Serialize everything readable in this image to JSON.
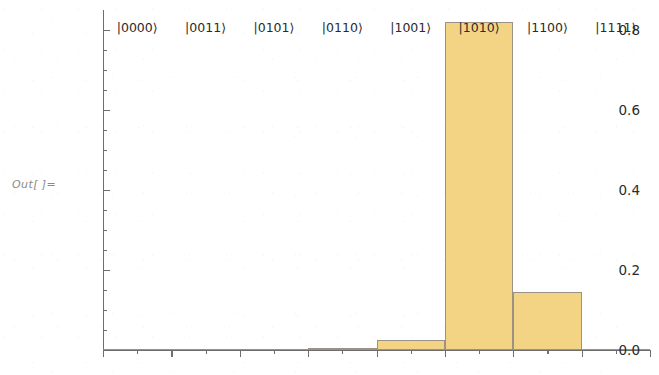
{
  "output_label": "Out[ ]=",
  "colors": {
    "bar_fill": "#F2D484",
    "bar_edge": "#9B9184",
    "axis": "#6E6E6E",
    "text": "#2B2B2B",
    "label_gray": "#8A8A8A",
    "background": "#FFFFFF"
  },
  "chart_data": {
    "type": "bar",
    "title": "",
    "subtitle": "",
    "xlabel": "",
    "ylabel": "",
    "categories": [
      "|0000⟩",
      "|0011⟩",
      "|0101⟩",
      "|0110⟩",
      "|1001⟩",
      "|1010⟩",
      "|1100⟩",
      "|1111⟩"
    ],
    "values": [
      0.0,
      0.0,
      0.0,
      0.005,
      0.025,
      0.82,
      0.145,
      0.0
    ],
    "ylim": [
      0.0,
      0.85
    ],
    "ytick_labels": [
      "0.0",
      "0.2",
      "0.4",
      "0.6",
      "0.8"
    ],
    "ytick_values": [
      0.0,
      0.2,
      0.4,
      0.6,
      0.8
    ],
    "yminor_values": [
      0.05,
      0.1,
      0.15,
      0.25,
      0.3,
      0.35,
      0.45,
      0.5,
      0.55,
      0.65,
      0.7,
      0.75
    ],
    "grid": false,
    "legend": null,
    "legend_position": "none"
  }
}
